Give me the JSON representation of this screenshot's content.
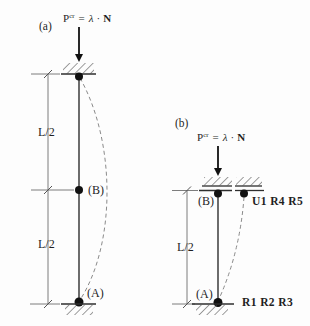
{
  "colors": {
    "background": "#fdfdfd",
    "primary_line": "#2e2e2e",
    "dimension_line": "#6e6e6e",
    "deflection_dash": "#8a8a8a",
    "hatch": "#4f4f4f",
    "text": "#1f1f1f",
    "node_dot": "#111111"
  },
  "figure_a": {
    "label": "(a)",
    "load_formula": {
      "p": "P",
      "sup": "cr",
      "equals": "=",
      "lambda": "λ",
      "cdot": "·",
      "n": "N"
    },
    "dim_upper": "L/2",
    "dim_lower": "L/2",
    "node_mid_label": "(B)",
    "node_bottom_label": "(A)"
  },
  "figure_b": {
    "label": "(b)",
    "load_formula": {
      "p": "P",
      "sup": "cr",
      "equals": "=",
      "lambda": "λ",
      "cdot": "·",
      "n": "N"
    },
    "dim_lower": "L/2",
    "node_top_label": "(B)",
    "node_bottom_label": "(A)",
    "restraint_top": "U1 R4 R5",
    "restraint_bottom": "R1 R2 R3"
  }
}
